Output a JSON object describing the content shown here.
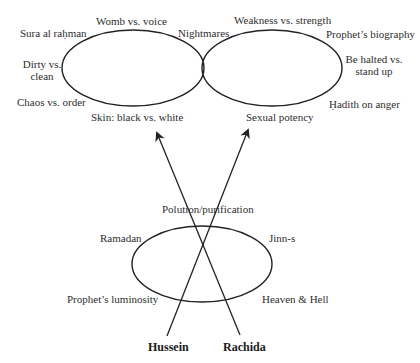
{
  "diagram": {
    "top_left_cluster": {
      "labels": {
        "top": "Womb vs. voice",
        "top_left": "Sura al raḥman",
        "left": "Dirty vs. clean",
        "left_line1": "Dirty vs.",
        "left_line2": "clean",
        "bottom_left": "Chaos vs. order",
        "bottom": "Skin: black vs. white"
      }
    },
    "top_right_cluster": {
      "labels": {
        "top_left": "Nightmares",
        "top": "Weakness vs. strength",
        "top_right": "Prophet’s biography",
        "right": "Be halted vs. stand up",
        "right_line1": "Be halted vs.",
        "right_line2": "stand up",
        "bottom_right": "Ḥadith on anger",
        "bottom": "Sexual potency"
      }
    },
    "bottom_cluster": {
      "labels": {
        "top": "Polution/purification",
        "top_left": "Ramadan",
        "top_right": "Jinn-s",
        "bottom_left": "Prophet’s luminosity",
        "bottom_right": "Heaven & Hell"
      }
    },
    "persons": {
      "left": "Hussein",
      "right": "Rachida"
    },
    "colors": {
      "stroke": "#222222",
      "text": "#2e2e2e"
    }
  }
}
